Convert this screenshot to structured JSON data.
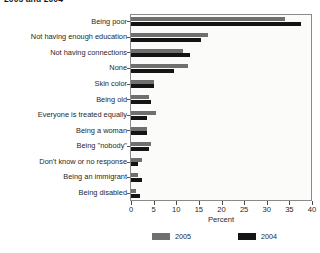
{
  "title_fragment": "2005 and 2004",
  "chart_data": {
    "type": "bar",
    "orientation": "horizontal",
    "title": "2005 and 2004",
    "xlabel": "Percent",
    "ylabel": "",
    "xlim": [
      0,
      40
    ],
    "xticks": [
      0,
      5,
      10,
      15,
      20,
      25,
      30,
      35,
      40
    ],
    "xticklabels": [
      "0",
      "5",
      "10",
      "15",
      "20",
      "25",
      "30",
      "35",
      "40"
    ],
    "grid": false,
    "legend_position": "bottom",
    "categories": [
      "Being poor",
      "Not having enough education",
      "Not having connections",
      "None",
      "Skin color",
      "Being old",
      "Everyone is treated equally",
      "Being a woman",
      "Being \"nobody\"",
      "Don't know or no response",
      "Being an immigrant",
      "Being disabled"
    ],
    "series": [
      {
        "name": "2005",
        "color": "#6f6f6f",
        "values": [
          34.0,
          17.0,
          11.5,
          12.5,
          5.0,
          4.0,
          5.5,
          3.5,
          4.5,
          2.5,
          1.5,
          1.0
        ]
      },
      {
        "name": "2004",
        "color": "#141414",
        "values": [
          37.5,
          15.5,
          13.0,
          9.5,
          5.0,
          4.5,
          3.5,
          3.5,
          4.0,
          1.5,
          2.5,
          2.0
        ]
      }
    ]
  },
  "legend": [
    {
      "label": "2005",
      "color": "#6f6f6f"
    },
    {
      "label": "2004",
      "color": "#141414"
    }
  ]
}
